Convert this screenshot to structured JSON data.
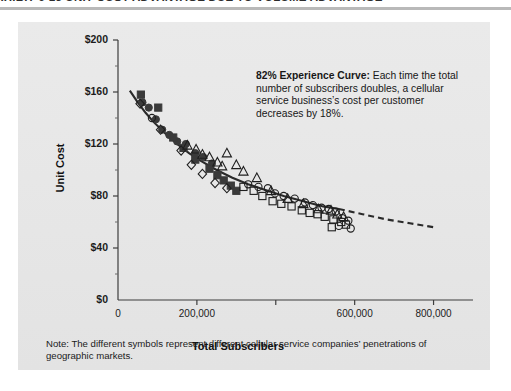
{
  "exhibit": {
    "title": "EXHIBIT 6-13 UNIT COST ADVANTAGE DUE TO VOLUME ADVANTAGE"
  },
  "callout": {
    "lead": "82% Experience Curve:",
    "body": " Each time the total number of subscribers doubles, a cellular service business’s cost per customer decreases by 18%."
  },
  "footnote": {
    "text": "Note: The different symbols represent different cellular service companies’ penetrations of geographic markets."
  },
  "chart_data": {
    "type": "scatter",
    "title": "UNIT COST ADVANTAGE DUE TO VOLUME ADVANTAGE",
    "xlabel": "Total Subscribers",
    "ylabel": "Unit Cost",
    "xlim": [
      0,
      900000
    ],
    "ylim": [
      0,
      200
    ],
    "xticks": [
      0,
      200000,
      400000,
      600000,
      800000
    ],
    "xticklabels": [
      "0",
      "200,000",
      "",
      "600,000",
      "800,000"
    ],
    "yticks": [
      0,
      40,
      80,
      120,
      160,
      200
    ],
    "yticklabels": [
      "$0",
      "$40",
      "$80",
      "$120",
      "$160",
      "$200"
    ],
    "grid": false,
    "legend": "none",
    "annotations": [
      "82% Experience Curve: Each time the total number of subscribers doubles, a cellular service business’s cost per customer decreases by 18%.",
      "Note: The different symbols represent different cellular service companies’ penetrations of geographic markets."
    ],
    "fit_curve": {
      "name": "82% experience curve",
      "style_solid": "solid",
      "style_extrapolation": "dashed",
      "solid_range": [
        30000,
        560000
      ],
      "dashed_range": [
        560000,
        800000
      ],
      "points": [
        [
          30000,
          161
        ],
        [
          50000,
          152
        ],
        [
          70000,
          144
        ],
        [
          90000,
          137
        ],
        [
          120000,
          128
        ],
        [
          150000,
          120
        ],
        [
          180000,
          113
        ],
        [
          210000,
          107
        ],
        [
          250000,
          100
        ],
        [
          290000,
          94
        ],
        [
          330000,
          89
        ],
        [
          370000,
          85
        ],
        [
          420000,
          80
        ],
        [
          470000,
          76
        ],
        [
          520000,
          72
        ],
        [
          560000,
          70
        ],
        [
          620000,
          66
        ],
        [
          680000,
          62
        ],
        [
          740000,
          59
        ],
        [
          800000,
          56
        ]
      ]
    },
    "series": [
      {
        "name": "Company A",
        "marker": "filled-circle",
        "color": "#3a3a3a",
        "points": [
          [
            62000,
            152
          ],
          [
            78000,
            148
          ],
          [
            96000,
            139
          ],
          [
            112000,
            131
          ],
          [
            130000,
            127
          ],
          [
            150000,
            122
          ],
          [
            172000,
            120
          ],
          [
            196000,
            113
          ],
          [
            216000,
            110
          ],
          [
            238000,
            105
          ]
        ]
      },
      {
        "name": "Company B",
        "marker": "filled-square",
        "color": "#3a3a3a",
        "points": [
          [
            58000,
            158
          ],
          [
            102000,
            148
          ],
          [
            140000,
            125
          ],
          [
            166000,
            117
          ],
          [
            196000,
            108
          ],
          [
            232000,
            101
          ],
          [
            252000,
            96
          ],
          [
            268000,
            92
          ],
          [
            286000,
            88
          ],
          [
            300000,
            84
          ]
        ]
      },
      {
        "name": "Company C",
        "marker": "open-diamond",
        "color": "#1f1f1f",
        "points": [
          [
            56000,
            151
          ],
          [
            108000,
            131
          ],
          [
            160000,
            115
          ],
          [
            186000,
            104
          ],
          [
            214000,
            97
          ],
          [
            246000,
            90
          ],
          [
            276000,
            86
          ]
        ]
      },
      {
        "name": "Company D",
        "marker": "open-triangle",
        "color": "#1f1f1f",
        "points": [
          [
            176000,
            119
          ],
          [
            198000,
            116
          ],
          [
            214000,
            112
          ],
          [
            232000,
            110
          ],
          [
            252000,
            106
          ],
          [
            264000,
            103
          ],
          [
            276000,
            113
          ],
          [
            300000,
            104
          ],
          [
            318000,
            99
          ],
          [
            352000,
            94
          ],
          [
            388000,
            84
          ],
          [
            430000,
            78
          ],
          [
            470000,
            74
          ],
          [
            508000,
            70
          ],
          [
            540000,
            69
          ],
          [
            556000,
            66
          ],
          [
            572000,
            64
          ]
        ]
      },
      {
        "name": "Company E",
        "marker": "open-circle",
        "color": "#1f1f1f",
        "points": [
          [
            86000,
            140
          ],
          [
            330000,
            89
          ],
          [
            356000,
            87
          ],
          [
            380000,
            86
          ],
          [
            398000,
            82
          ],
          [
            420000,
            80
          ],
          [
            448000,
            78
          ],
          [
            474000,
            75
          ],
          [
            494000,
            73
          ],
          [
            516000,
            71
          ],
          [
            534000,
            70
          ],
          [
            552000,
            68
          ],
          [
            568000,
            63
          ],
          [
            584000,
            61
          ],
          [
            560000,
            57
          ],
          [
            590000,
            55
          ]
        ]
      },
      {
        "name": "Company F",
        "marker": "open-square",
        "color": "#1f1f1f",
        "points": [
          [
            318000,
            87
          ],
          [
            344000,
            84
          ],
          [
            366000,
            80
          ],
          [
            392000,
            76
          ],
          [
            414000,
            74
          ],
          [
            440000,
            72
          ],
          [
            466000,
            69
          ],
          [
            486000,
            67
          ],
          [
            506000,
            66
          ],
          [
            524000,
            64
          ],
          [
            546000,
            62
          ],
          [
            566000,
            60
          ],
          [
            542000,
            56
          ],
          [
            578000,
            58
          ]
        ]
      }
    ]
  }
}
